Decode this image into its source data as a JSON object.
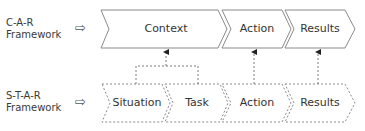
{
  "rows": [
    {
      "id": "car",
      "label_lines": [
        "C-A-R",
        "Framework"
      ],
      "pointer_glyph": "⇨",
      "border_style": "solid",
      "steps": [
        {
          "label": "Context"
        },
        {
          "label": "Action"
        },
        {
          "label": "Results"
        }
      ]
    },
    {
      "id": "star",
      "label_lines": [
        "S-T-A-R",
        "Framework"
      ],
      "pointer_glyph": "⇨",
      "border_style": "dashed",
      "steps": [
        {
          "label": "Situation"
        },
        {
          "label": "Task"
        },
        {
          "label": "Action"
        },
        {
          "label": "Results"
        }
      ]
    }
  ],
  "mappings": [
    {
      "from": [
        "Situation",
        "Task"
      ],
      "to": "Context"
    },
    {
      "from": [
        "Action"
      ],
      "to": "Action"
    },
    {
      "from": [
        "Results"
      ],
      "to": "Results"
    }
  ],
  "colors": {
    "stroke": "#8a8a8a",
    "text": "#333333",
    "background": "#ffffff"
  }
}
